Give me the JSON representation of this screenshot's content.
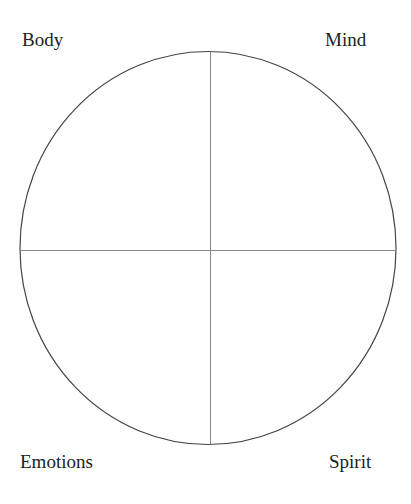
{
  "diagram": {
    "labels": {
      "top_left": "Body",
      "top_right": "Mind",
      "bottom_left": "Emotions",
      "bottom_right": "Spirit"
    },
    "colors": {
      "circle_stroke": "#444444",
      "divider_stroke": "#777777",
      "text": "#222222"
    }
  }
}
